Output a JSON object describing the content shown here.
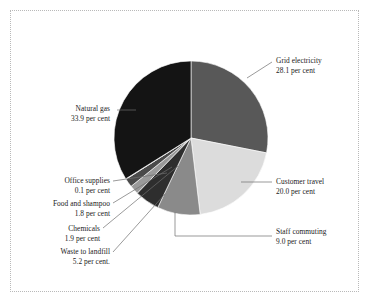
{
  "figure": {
    "background_color": "#ffffff",
    "border_color": "#b9b9b9",
    "text_color": "#1a1a1a",
    "unit_suffix": "per cent"
  },
  "chart_data": {
    "type": "pie",
    "title": "",
    "legend_position": "none",
    "start_angle_deg": 0,
    "direction": "clockwise",
    "center": {
      "x": 191,
      "y": 138
    },
    "radius": 77,
    "total": 100.0,
    "labels": [
      "Grid electricity",
      "Customer travel",
      "Staff commuting",
      "Waste to landfill",
      "Chemicals",
      "Food and shampoo",
      "Office supplies",
      "Natural gas"
    ],
    "values": [
      28.1,
      20.0,
      9.0,
      5.2,
      1.9,
      1.8,
      0.1,
      33.9
    ],
    "colors": [
      "#585858",
      "#dcdcdc",
      "#8a8a8a",
      "#2e2e2e",
      "#9a9a9a",
      "#4a4a4a",
      "#b0b0b0",
      "#141414"
    ],
    "slices": [
      {
        "label": "Grid electricity",
        "value": 28.1,
        "value_text": "28.1 per cent",
        "color": "#585858"
      },
      {
        "label": "Customer travel",
        "value": 20.0,
        "value_text": "20.0 per cent",
        "color": "#dcdcdc"
      },
      {
        "label": "Staff commuting",
        "value": 9.0,
        "value_text": "9.0 per cent",
        "color": "#8a8a8a"
      },
      {
        "label": "Waste to landfill",
        "value": 5.2,
        "value_text": "5.2 per cent.",
        "color": "#2e2e2e"
      },
      {
        "label": "Chemicals",
        "value": 1.9,
        "value_text": "1.9 per cent",
        "color": "#9a9a9a"
      },
      {
        "label": "Food and shampoo",
        "value": 1.8,
        "value_text": "1.8 per cent",
        "color": "#4a4a4a"
      },
      {
        "label": "Office supplies",
        "value": 0.1,
        "value_text": "0.1 per cent",
        "color": "#b0b0b0"
      },
      {
        "label": "Natural gas",
        "value": 33.9,
        "value_text": "33.9 per cent",
        "color": "#141414"
      }
    ]
  }
}
